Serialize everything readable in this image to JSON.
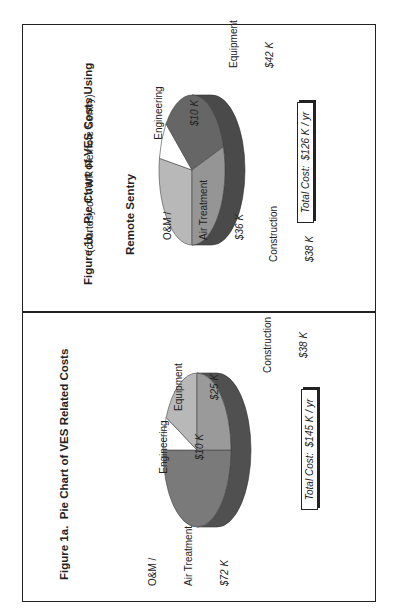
{
  "figures": [
    {
      "id": "1a",
      "title": "Figure 1a.  Pie Chart of VES Related Costs",
      "total_label": "Total Cost:  $145 K / yr",
      "labels": {
        "om_line1": "O&M /",
        "om_line2": "Air Treatment",
        "om_value": "$72 K",
        "engineering": "Engineering",
        "engineering_value": "$10 K",
        "equipment": "Equipment",
        "equipment_value": "$25 K",
        "construction": "Construction",
        "construction_value": "$38 K"
      }
    },
    {
      "id": "1b",
      "title": "Figure 1b.  Pie Chart of VES Costs Using",
      "title_line2": "Remote Sentry",
      "subtitle": "(courtesy of VWR Remote Sentry)",
      "total_label": "Total Cost:  $126 K / yr",
      "labels": {
        "om_line1": "O&M /",
        "om_line2": "Air Treatment",
        "om_value": "$36 K",
        "engineering": "Engineering",
        "engineering_value": "$10 K",
        "equipment": "Equipment",
        "equipment_value": "$42 K",
        "construction": "Construction",
        "construction_value": "$38 K"
      }
    }
  ],
  "chart_data": [
    {
      "type": "pie",
      "title": "Figure 1a. Pie Chart of VES Related Costs",
      "categories": [
        "O&M / Air Treatment",
        "Engineering",
        "Equipment",
        "Construction"
      ],
      "values": [
        72,
        10,
        25,
        38
      ],
      "unit": "$K",
      "total": 145,
      "annotation": "Total Cost: $145 K / yr",
      "style": "3d",
      "colors": [
        "#7a7a7a",
        "#ffffff",
        "#b8b8b8",
        "#9a9a9a"
      ],
      "side_color": "#505050",
      "geometry": {
        "cx": 165,
        "cy": 197,
        "rx": 77,
        "ry": 34,
        "depth": 20
      },
      "angles": [
        [
          90,
          270
        ],
        [
          270,
          295
        ],
        [
          295,
          360
        ],
        [
          0,
          90
        ]
      ]
    },
    {
      "type": "pie",
      "title": "Figure 1b. Pie Chart of VES Costs Using Remote Sentry",
      "subtitle": "(courtesy of VWR Remote Sentry)",
      "categories": [
        "O&M / Air Treatment",
        "Engineering",
        "Equipment",
        "Construction"
      ],
      "values": [
        36,
        10,
        42,
        38
      ],
      "unit": "$K",
      "total": 126,
      "annotation": "Total Cost: $126 K / yr",
      "style": "3d",
      "colors": [
        "#b8b8b8",
        "#ffffff",
        "#666666",
        "#959595"
      ],
      "side_color": "#4a4a4a",
      "geometry": {
        "cx": 445,
        "cy": 192,
        "rx": 75,
        "ry": 33,
        "depth": 20
      },
      "angles": [
        [
          180,
          279
        ],
        [
          279,
          308
        ],
        [
          308,
          432
        ],
        [
          72,
          180
        ]
      ]
    }
  ]
}
